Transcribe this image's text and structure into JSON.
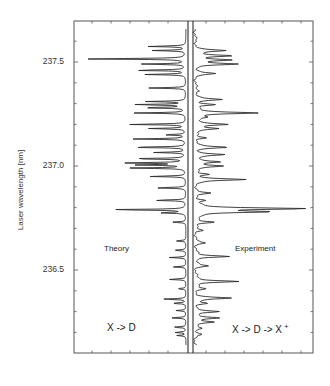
{
  "chart_data": {
    "type": "line",
    "title": "",
    "xlabel": "",
    "ylabel": "Laser wavelength [nm]",
    "ylim": [
      236.1,
      237.65
    ],
    "yticks": [
      236.5,
      237.0,
      237.5
    ],
    "ytick_labels": [
      "236.5",
      "237.0",
      "237.5"
    ],
    "minor_tick_step": 0.1,
    "grid": false,
    "layout": "mirrored back-to-back spectra sharing wavelength axis; theory plotted leftward, experiment rightward",
    "series": [
      {
        "name": "Theory",
        "process_label": "X -> D",
        "direction": "left",
        "peaks": [
          {
            "wl": 237.575,
            "intensity": 0.35
          },
          {
            "wl": 237.555,
            "intensity": 0.3
          },
          {
            "wl": 237.515,
            "intensity": 0.93
          },
          {
            "wl": 237.49,
            "intensity": 0.4
          },
          {
            "wl": 237.46,
            "intensity": 0.48
          },
          {
            "wl": 237.44,
            "intensity": 0.36
          },
          {
            "wl": 237.375,
            "intensity": 0.33
          },
          {
            "wl": 237.31,
            "intensity": 0.35
          },
          {
            "wl": 237.295,
            "intensity": 0.48
          },
          {
            "wl": 237.28,
            "intensity": 0.42
          },
          {
            "wl": 237.255,
            "intensity": 0.46
          },
          {
            "wl": 237.2,
            "intensity": 0.52
          },
          {
            "wl": 237.18,
            "intensity": 0.33
          },
          {
            "wl": 237.15,
            "intensity": 0.2
          },
          {
            "wl": 237.13,
            "intensity": 0.47
          },
          {
            "wl": 237.09,
            "intensity": 0.52
          },
          {
            "wl": 237.065,
            "intensity": 0.28
          },
          {
            "wl": 237.035,
            "intensity": 0.5
          },
          {
            "wl": 237.015,
            "intensity": 0.55
          },
          {
            "wl": 237.005,
            "intensity": 0.42
          },
          {
            "wl": 236.99,
            "intensity": 0.5
          },
          {
            "wl": 236.95,
            "intensity": 0.33
          },
          {
            "wl": 236.895,
            "intensity": 0.28
          },
          {
            "wl": 236.835,
            "intensity": 0.3
          },
          {
            "wl": 236.79,
            "intensity": 0.72
          },
          {
            "wl": 236.775,
            "intensity": 0.25
          },
          {
            "wl": 236.73,
            "intensity": 0.13
          },
          {
            "wl": 236.64,
            "intensity": 0.09
          },
          {
            "wl": 236.595,
            "intensity": 0.12
          },
          {
            "wl": 236.56,
            "intensity": 0.15
          },
          {
            "wl": 236.515,
            "intensity": 0.12
          },
          {
            "wl": 236.455,
            "intensity": 0.16
          },
          {
            "wl": 236.41,
            "intensity": 0.08
          },
          {
            "wl": 236.36,
            "intensity": 0.21
          },
          {
            "wl": 236.34,
            "intensity": 0.13
          },
          {
            "wl": 236.305,
            "intensity": 0.09
          },
          {
            "wl": 236.27,
            "intensity": 0.14
          },
          {
            "wl": 236.225,
            "intensity": 0.12
          },
          {
            "wl": 236.2,
            "intensity": 0.1
          },
          {
            "wl": 236.185,
            "intensity": 0.08
          }
        ]
      },
      {
        "name": "Experiment",
        "process_label": "X -> D -> X +",
        "direction": "right",
        "peaks": [
          {
            "wl": 237.555,
            "intensity": 0.27
          },
          {
            "wl": 237.53,
            "intensity": 0.34
          },
          {
            "wl": 237.51,
            "intensity": 0.3
          },
          {
            "wl": 237.49,
            "intensity": 0.37
          },
          {
            "wl": 237.445,
            "intensity": 0.18
          },
          {
            "wl": 237.36,
            "intensity": 0.05
          },
          {
            "wl": 237.32,
            "intensity": 0.24
          },
          {
            "wl": 237.295,
            "intensity": 0.18
          },
          {
            "wl": 237.255,
            "intensity": 0.58
          },
          {
            "wl": 237.235,
            "intensity": 0.1
          },
          {
            "wl": 237.2,
            "intensity": 0.3
          },
          {
            "wl": 237.18,
            "intensity": 0.22
          },
          {
            "wl": 237.135,
            "intensity": 0.1
          },
          {
            "wl": 237.09,
            "intensity": 0.3
          },
          {
            "wl": 237.055,
            "intensity": 0.27
          },
          {
            "wl": 237.02,
            "intensity": 0.24
          },
          {
            "wl": 237.0,
            "intensity": 0.25
          },
          {
            "wl": 236.96,
            "intensity": 0.12
          },
          {
            "wl": 236.935,
            "intensity": 0.46
          },
          {
            "wl": 236.87,
            "intensity": 0.12
          },
          {
            "wl": 236.835,
            "intensity": 0.08
          },
          {
            "wl": 236.795,
            "intensity": 1.0
          },
          {
            "wl": 236.78,
            "intensity": 0.65
          },
          {
            "wl": 236.73,
            "intensity": 0.18
          },
          {
            "wl": 236.69,
            "intensity": 0.06
          },
          {
            "wl": 236.63,
            "intensity": 0.1
          },
          {
            "wl": 236.565,
            "intensity": 0.32
          },
          {
            "wl": 236.52,
            "intensity": 0.12
          },
          {
            "wl": 236.445,
            "intensity": 0.41
          },
          {
            "wl": 236.41,
            "intensity": 0.08
          },
          {
            "wl": 236.365,
            "intensity": 0.33
          },
          {
            "wl": 236.34,
            "intensity": 0.11
          },
          {
            "wl": 236.3,
            "intensity": 0.2
          },
          {
            "wl": 236.27,
            "intensity": 0.23
          },
          {
            "wl": 236.25,
            "intensity": 0.15
          },
          {
            "wl": 236.22,
            "intensity": 0.08
          },
          {
            "wl": 236.19,
            "intensity": 0.05
          }
        ]
      }
    ],
    "annotations": [
      "Theory",
      "Experiment",
      "X -> D",
      "X -> D -> X +"
    ]
  },
  "axis": {
    "ylabel": "Laser wavelength [nm]",
    "ticks": [
      {
        "label": "237.5",
        "value": 237.5
      },
      {
        "label": "237.0",
        "value": 237.0
      },
      {
        "label": "236.5",
        "value": 236.5
      }
    ]
  },
  "labels": {
    "theory": "Theory",
    "experiment": "Experiment",
    "theory_process": "X -> D",
    "experiment_process": "X -> D -> X",
    "experiment_superscript": "+"
  },
  "style": {
    "line_color": "#2b2b2b",
    "frame_color": "#555555",
    "background": "#ffffff"
  }
}
